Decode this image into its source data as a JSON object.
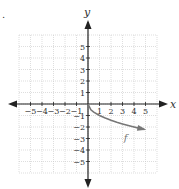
{
  "marker": ".",
  "chart_data": {
    "type": "line",
    "title": "",
    "xlabel": "x",
    "ylabel": "y",
    "xlim": [
      -6,
      6
    ],
    "ylim": [
      -6,
      6
    ],
    "grid": true,
    "x_ticks": [
      -5,
      -4,
      -3,
      -2,
      -1,
      1,
      2,
      3,
      4,
      5
    ],
    "y_ticks": [
      -5,
      -4,
      -3,
      -2,
      -1,
      1,
      2,
      3,
      4,
      5
    ],
    "series": [
      {
        "name": "f",
        "label": "f",
        "description": "curve starting at origin, decreasing, ending with arrow near (5, -2.2)",
        "x": [
          0,
          0.25,
          0.5,
          1,
          1.5,
          2,
          2.5,
          3,
          3.5,
          4,
          4.5,
          4.9
        ],
        "y": [
          0,
          -0.5,
          -0.71,
          -1,
          -1.22,
          -1.41,
          -1.58,
          -1.73,
          -1.87,
          -2,
          -2.12,
          -2.21
        ]
      }
    ],
    "colors": {
      "axis": "#222222",
      "grid": "#c8c8c8",
      "curve": "#777777"
    }
  }
}
